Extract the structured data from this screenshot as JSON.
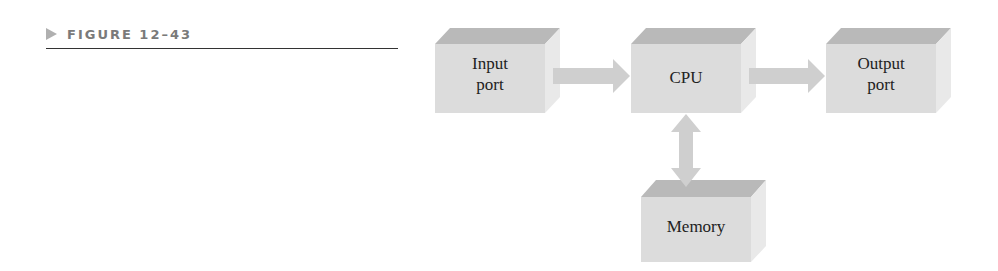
{
  "figure": {
    "label": "FIGURE 12–43",
    "marker_icon": "triangle-right-icon"
  },
  "diagram": {
    "type": "block-diagram",
    "blocks": [
      {
        "id": "input",
        "lines": [
          "Input",
          "port"
        ]
      },
      {
        "id": "cpu",
        "lines": [
          "CPU"
        ]
      },
      {
        "id": "output",
        "lines": [
          "Output",
          "port"
        ]
      },
      {
        "id": "memory",
        "lines": [
          "Memory"
        ]
      }
    ],
    "connections": [
      {
        "from": "input",
        "to": "cpu",
        "direction": "one-way"
      },
      {
        "from": "cpu",
        "to": "output",
        "direction": "one-way"
      },
      {
        "from": "cpu",
        "to": "memory",
        "direction": "two-way"
      }
    ],
    "colors": {
      "box_front": "#dcdcdc",
      "box_top": "#b9b9b9",
      "box_side": "#e9e9e9",
      "arrow": "#cfcfcf",
      "label_text": "#222222",
      "figure_label": "#7a7a7a"
    }
  }
}
